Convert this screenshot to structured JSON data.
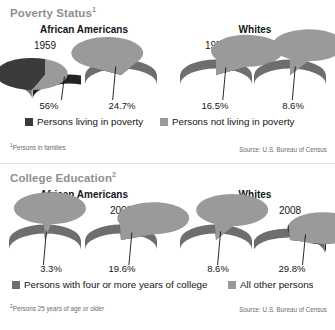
{
  "colors": {
    "dark": "#3b3b3b",
    "dark_side": "#232323",
    "light": "#9a9a9a",
    "light_side": "#6e6e6e",
    "title_gray": "#8f8f8f",
    "text": "#151515",
    "footnote": "#6b6b6b"
  },
  "sections": [
    {
      "title": "Poverty Status",
      "title_footnote_marker": "1",
      "groups": [
        {
          "label": "African Americans"
        },
        {
          "label": "Whites"
        }
      ],
      "charts": [
        {
          "group": "African Americans",
          "year": "1959",
          "value_label": "56%",
          "value": 56.0
        },
        {
          "group": "African Americans",
          "year": "2008",
          "value_label": "24.7%",
          "value": 24.7
        },
        {
          "group": "Whites",
          "year": "1959",
          "value_label": "16.5%",
          "value": 16.5
        },
        {
          "group": "Whites",
          "year": "2008",
          "value_label": "8.6%",
          "value": 8.6
        }
      ],
      "legend": [
        {
          "label": "Persons living in poverty",
          "color": "dark"
        },
        {
          "label": "Persons not living in poverty",
          "color": "light"
        }
      ],
      "footnote": "Persons in families",
      "footnote_marker": "1",
      "source": "Source: U.S. Bureau of Census"
    },
    {
      "title": "College Education",
      "title_footnote_marker": "2",
      "groups": [
        {
          "label": "African Americans"
        },
        {
          "label": "Whites"
        }
      ],
      "charts": [
        {
          "group": "African Americans",
          "year": "1959",
          "value_label": "3.3%",
          "value": 3.3
        },
        {
          "group": "African Americans",
          "year": "2008",
          "value_label": "19.6%",
          "value": 19.6
        },
        {
          "group": "Whites",
          "year": "1959",
          "value_label": "8.6%",
          "value": 8.6
        },
        {
          "group": "Whites",
          "year": "2008",
          "value_label": "29.8%",
          "value": 29.8
        }
      ],
      "legend": [
        {
          "label": "Persons with four or more years of college",
          "color": "dark"
        },
        {
          "label": "All other persons",
          "color": "light"
        }
      ],
      "footnote": "Persons 25 years of age or older",
      "footnote_marker": "2",
      "source": "Source: U.S. Bureau of Census"
    }
  ],
  "chart_data": [
    {
      "type": "pie",
      "title": "Poverty Status (Persons in families)",
      "subtitle": "African Americans vs. Whites, 1959 and 2008",
      "xlabel": "",
      "ylabel": "",
      "legend_position": "bottom",
      "grid": false,
      "source": "Source: U.S. Bureau of Census",
      "units": "percent",
      "slice_labels": [
        "Persons living in poverty",
        "Persons not living in poverty"
      ],
      "panels": [
        {
          "group": "African Americans",
          "year": 1959,
          "categories": [
            "Persons living in poverty",
            "Persons not living in poverty"
          ],
          "values": [
            56.0,
            44.0
          ],
          "highlight": "56%"
        },
        {
          "group": "African Americans",
          "year": 2008,
          "categories": [
            "Persons living in poverty",
            "Persons not living in poverty"
          ],
          "values": [
            24.7,
            75.3
          ],
          "highlight": "24.7%"
        },
        {
          "group": "Whites",
          "year": 1959,
          "categories": [
            "Persons living in poverty",
            "Persons not living in poverty"
          ],
          "values": [
            16.5,
            83.5
          ],
          "highlight": "16.5%"
        },
        {
          "group": "Whites",
          "year": 2008,
          "categories": [
            "Persons living in poverty",
            "Persons not living in poverty"
          ],
          "values": [
            8.6,
            91.4
          ],
          "highlight": "8.6%"
        }
      ]
    },
    {
      "type": "pie",
      "title": "College Education (Persons 25 years of age or older)",
      "subtitle": "African Americans vs. Whites, 1959 and 2008",
      "xlabel": "",
      "ylabel": "",
      "legend_position": "bottom",
      "grid": false,
      "source": "Source: U.S. Bureau of Census",
      "units": "percent",
      "slice_labels": [
        "Persons with four or more years of college",
        "All other persons"
      ],
      "panels": [
        {
          "group": "African Americans",
          "year": 1959,
          "categories": [
            "Persons with four or more years of college",
            "All other persons"
          ],
          "values": [
            3.3,
            96.7
          ],
          "highlight": "3.3%"
        },
        {
          "group": "African Americans",
          "year": 2008,
          "categories": [
            "Persons with four or more years of college",
            "All other persons"
          ],
          "values": [
            19.6,
            80.4
          ],
          "highlight": "19.6%"
        },
        {
          "group": "Whites",
          "year": 1959,
          "categories": [
            "Persons with four or more years of college",
            "All other persons"
          ],
          "values": [
            8.6,
            91.4
          ],
          "highlight": "8.6%"
        },
        {
          "group": "Whites",
          "year": 2008,
          "categories": [
            "Persons with four or more years of college",
            "All other persons"
          ],
          "values": [
            29.8,
            70.2
          ],
          "highlight": "29.8%"
        }
      ]
    }
  ]
}
